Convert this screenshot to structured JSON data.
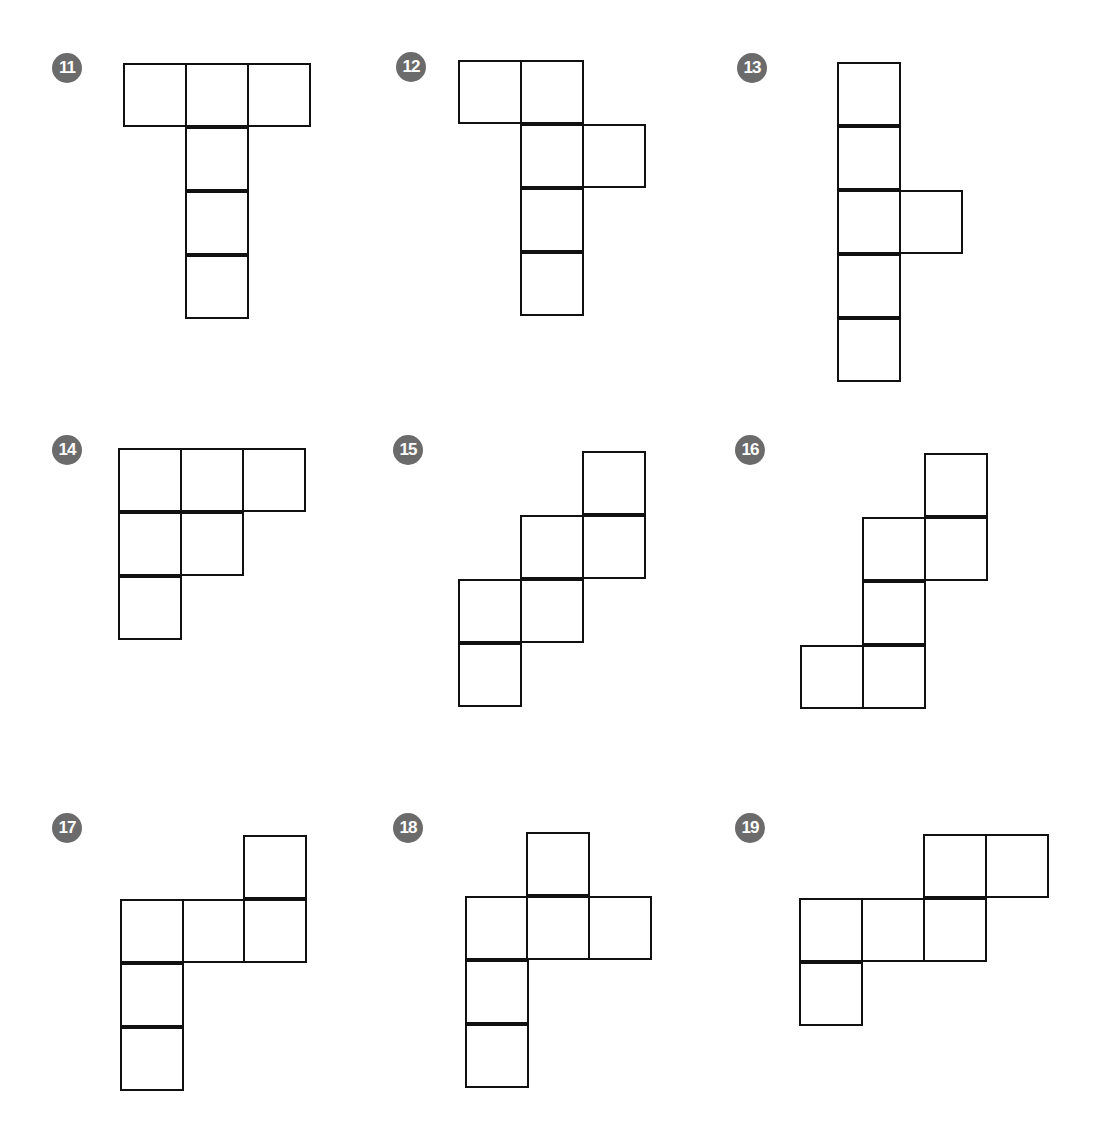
{
  "cell_size": 62,
  "nets": [
    {
      "label": "11",
      "badge": [
        67,
        68
      ],
      "cells": [
        [
          123,
          63
        ],
        [
          185,
          63
        ],
        [
          247,
          63
        ],
        [
          185,
          127
        ],
        [
          185,
          191
        ],
        [
          185,
          255
        ]
      ]
    },
    {
      "label": "12",
      "badge": [
        411,
        67
      ],
      "cells": [
        [
          458,
          60
        ],
        [
          520,
          60
        ],
        [
          520,
          124
        ],
        [
          582,
          124
        ],
        [
          520,
          188
        ],
        [
          520,
          252
        ]
      ]
    },
    {
      "label": "13",
      "badge": [
        752,
        68
      ],
      "cells": [
        [
          837,
          62
        ],
        [
          837,
          126
        ],
        [
          837,
          190
        ],
        [
          899,
          190
        ],
        [
          837,
          254
        ],
        [
          837,
          318
        ]
      ]
    },
    {
      "label": "14",
      "badge": [
        67,
        450
      ],
      "cells": [
        [
          118,
          448
        ],
        [
          180,
          448
        ],
        [
          242,
          448
        ],
        [
          118,
          512
        ],
        [
          180,
          512
        ],
        [
          118,
          576
        ]
      ]
    },
    {
      "label": "15",
      "badge": [
        408,
        450
      ],
      "cells": [
        [
          582,
          451
        ],
        [
          520,
          515
        ],
        [
          582,
          515
        ],
        [
          458,
          579
        ],
        [
          520,
          579
        ],
        [
          458,
          643
        ]
      ]
    },
    {
      "label": "16",
      "badge": [
        750,
        450
      ],
      "cells": [
        [
          924,
          453
        ],
        [
          862,
          517
        ],
        [
          924,
          517
        ],
        [
          862,
          581
        ],
        [
          800,
          645
        ],
        [
          862,
          645
        ]
      ]
    },
    {
      "label": "17",
      "badge": [
        67,
        828
      ],
      "cells": [
        [
          243,
          835
        ],
        [
          120,
          899
        ],
        [
          182,
          899
        ],
        [
          243,
          899
        ],
        [
          120,
          963
        ],
        [
          120,
          1027
        ]
      ]
    },
    {
      "label": "18",
      "badge": [
        408,
        828
      ],
      "cells": [
        [
          526,
          832
        ],
        [
          465,
          896
        ],
        [
          526,
          896
        ],
        [
          588,
          896
        ],
        [
          465,
          960
        ],
        [
          465,
          1024
        ]
      ]
    },
    {
      "label": "19",
      "badge": [
        750,
        828
      ],
      "cells": [
        [
          923,
          834
        ],
        [
          985,
          834
        ],
        [
          799,
          898
        ],
        [
          861,
          898
        ],
        [
          923,
          898
        ],
        [
          799,
          962
        ]
      ]
    }
  ]
}
